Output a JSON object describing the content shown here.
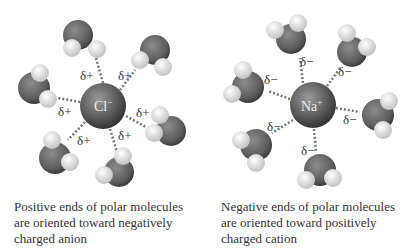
{
  "left_panel": {
    "ion": {
      "symbol": "Cl",
      "charge": "−"
    },
    "partial_label": "δ+",
    "caption": [
      "Positive ends of polar molecules",
      "are oriented toward negatively",
      "charged anion"
    ]
  },
  "right_panel": {
    "ion": {
      "symbol": "Na",
      "charge": "+"
    },
    "partial_label": "δ−",
    "caption": [
      "Negative ends of polar molecules",
      "are oriented toward positively",
      "charged cation"
    ]
  },
  "colors": {
    "oxygen": "#6b6b6b",
    "hydrogen": "#e6e6e6",
    "ion": "#5a5a5a",
    "bond": "#777777"
  }
}
